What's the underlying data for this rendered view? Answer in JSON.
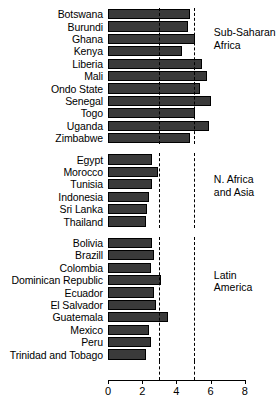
{
  "chart_data": {
    "type": "bar",
    "orientation": "horizontal",
    "title": "",
    "xlabel": "",
    "ylabel": "",
    "xlim": [
      0,
      8
    ],
    "xticks": [
      0,
      2,
      4,
      6,
      8
    ],
    "xtick_labels": [
      "0",
      "2",
      "4",
      "6",
      "8"
    ],
    "grid": false,
    "reference_lines": [
      3,
      5
    ],
    "bar_color": "#3a3a3a",
    "bar_edge_color": "#000000",
    "legend_position": "right-inline-group-labels",
    "groups": [
      {
        "name": "Sub-Saharan Africa",
        "label": "Sub-Saharan\nAfrica",
        "label_line_1": "Sub-Saharan",
        "label_line_2": "Africa",
        "categories": [
          "Botswana",
          "Burundi",
          "Ghana",
          "Kenya",
          "Liberia",
          "Mali",
          "Ondo State",
          "Senegal",
          "Togo",
          "Uganda",
          "Zimbabwe"
        ],
        "values": [
          4.8,
          4.7,
          5.1,
          4.3,
          5.5,
          5.8,
          5.4,
          6.0,
          5.1,
          5.9,
          4.8
        ]
      },
      {
        "name": "N. Africa and Asia",
        "label": "N. Africa\nand Asia",
        "label_line_1": "N. Africa",
        "label_line_2": "and Asia",
        "categories": [
          "Egypt",
          "Morocco",
          "Tunisia",
          "Indonesia",
          "Sri Lanka",
          "Thailand"
        ],
        "values": [
          2.6,
          2.9,
          2.6,
          2.4,
          2.3,
          2.2
        ]
      },
      {
        "name": "Latin America",
        "label": "Latin\nAmerica",
        "label_line_1": "Latin",
        "label_line_2": "America",
        "categories": [
          "Bolivia",
          "Brazill",
          "Colombia",
          "Dominican Republic",
          "Ecuador",
          "El Salvador",
          "Guatemala",
          "Mexico",
          "Peru",
          "Trinidad and Tobago"
        ],
        "values": [
          2.6,
          2.7,
          2.5,
          3.1,
          2.7,
          2.8,
          3.5,
          2.4,
          2.5,
          2.2
        ]
      }
    ]
  }
}
